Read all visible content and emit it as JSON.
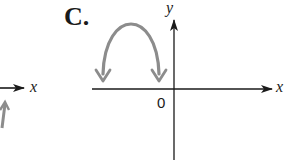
{
  "option_label": "C.",
  "axes": {
    "x_label": "x",
    "y_label": "y",
    "origin_label": "0"
  },
  "left_partial": {
    "x_label": "x"
  },
  "colors": {
    "axis": "#1a1a1a",
    "curve": "#8c8c8c",
    "background": "#ffffff"
  },
  "curve": {
    "shape": "downward-opening parabola",
    "position": "left of y-axis, above x-axis",
    "ends": "arrows pointing down toward x-axis"
  }
}
